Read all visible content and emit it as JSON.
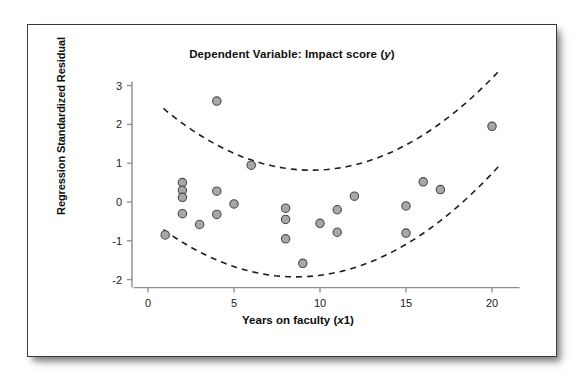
{
  "chart_data": {
    "type": "scatter",
    "title": "Dependent Variable: Impact score (y)",
    "title_prefix": "Dependent Variable: Impact score (",
    "title_italic": "y",
    "title_suffix": ")",
    "xlabel": "Years on faculty (x1)",
    "xlabel_prefix": "Years on faculty (",
    "xlabel_italic": "x",
    "xlabel_suffix": "1)",
    "ylabel": "Regression Standardized Residual",
    "xlim": [
      -0.6,
      21.6
    ],
    "ylim": [
      -2.45,
      3.35
    ],
    "xticks": [
      0,
      5,
      10,
      15,
      20
    ],
    "yticks": [
      -2,
      -1,
      0,
      1,
      2,
      3
    ],
    "xtick_labels": [
      "0",
      "5",
      "10",
      "15",
      "20"
    ],
    "ytick_labels": [
      "-2",
      "-1",
      "0",
      "1",
      "2",
      "3"
    ],
    "grid": false,
    "legend": false,
    "marker": {
      "shape": "circle",
      "fill_color": "#a8a8a8",
      "edge_color": "#4a4a4a",
      "radius": 4.2
    },
    "axis_color": "#8c8c8c",
    "points": [
      {
        "x": 1,
        "y": -0.85
      },
      {
        "x": 2,
        "y": 0.5
      },
      {
        "x": 2,
        "y": 0.3
      },
      {
        "x": 2,
        "y": 0.12
      },
      {
        "x": 2,
        "y": -0.3
      },
      {
        "x": 3,
        "y": -0.58
      },
      {
        "x": 4,
        "y": 2.6
      },
      {
        "x": 4,
        "y": 0.28
      },
      {
        "x": 4,
        "y": -0.32
      },
      {
        "x": 5,
        "y": -0.05
      },
      {
        "x": 6,
        "y": 0.95
      },
      {
        "x": 8,
        "y": -0.16
      },
      {
        "x": 8,
        "y": -0.45
      },
      {
        "x": 8,
        "y": -0.95
      },
      {
        "x": 9,
        "y": -1.58
      },
      {
        "x": 10,
        "y": -0.55
      },
      {
        "x": 11,
        "y": -0.2
      },
      {
        "x": 11,
        "y": -0.78
      },
      {
        "x": 12,
        "y": 0.15
      },
      {
        "x": 15,
        "y": -0.1
      },
      {
        "x": 15,
        "y": -0.8
      },
      {
        "x": 16,
        "y": 0.52
      },
      {
        "x": 17,
        "y": 0.32
      },
      {
        "x": 20,
        "y": 1.95
      }
    ],
    "bands": [
      {
        "name": "upper-confidence-band",
        "style": "dashed",
        "color": "#1f1f1f",
        "vertex_x": 9.5,
        "vertex_y": 0.82,
        "curvature": 0.0215,
        "x_start": 0.9,
        "x_end": 20.4
      },
      {
        "name": "lower-confidence-band",
        "style": "dashed",
        "color": "#1f1f1f",
        "vertex_x": 8.6,
        "vertex_y": -1.93,
        "curvature": 0.0205,
        "x_start": 0.9,
        "x_end": 20.4
      }
    ]
  }
}
